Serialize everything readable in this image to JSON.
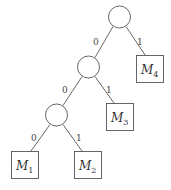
{
  "diagram": {
    "type": "binary-tree",
    "internal_nodes": [
      {
        "id": "n1",
        "cx": 119.5,
        "cy": 17,
        "r": 11
      },
      {
        "id": "n2",
        "cx": 88.5,
        "cy": 67,
        "r": 11
      },
      {
        "id": "n3",
        "cx": 56.5,
        "cy": 115,
        "r": 11
      }
    ],
    "leaves": [
      {
        "id": "M4",
        "base": "M",
        "sub": "4",
        "x": 136,
        "y": 55,
        "w": 28,
        "h": 28
      },
      {
        "id": "M3",
        "base": "M",
        "sub": "3",
        "x": 106,
        "y": 103,
        "w": 28,
        "h": 28
      },
      {
        "id": "M1",
        "base": "M",
        "sub": "1",
        "x": 11,
        "y": 151,
        "w": 28,
        "h": 28
      },
      {
        "id": "M2",
        "base": "M",
        "sub": "2",
        "x": 74,
        "y": 151,
        "w": 28,
        "h": 28
      }
    ],
    "edges": [
      {
        "from": "n1",
        "to": "n2",
        "label": "0"
      },
      {
        "from": "n1",
        "to": "M4",
        "label": "1"
      },
      {
        "from": "n2",
        "to": "n3",
        "label": "0"
      },
      {
        "from": "n2",
        "to": "M3",
        "label": "1"
      },
      {
        "from": "n3",
        "to": "M1",
        "label": "0"
      },
      {
        "from": "n3",
        "to": "M2",
        "label": "1"
      }
    ],
    "edge_labels": {
      "n1_left": "0",
      "n1_right": "1",
      "n2_left": "0",
      "n2_right": "1",
      "n3_left": "0",
      "n3_right": "1"
    },
    "leaf_labels": {
      "m1": {
        "base": "M",
        "sub": "1"
      },
      "m2": {
        "base": "M",
        "sub": "2"
      },
      "m3": {
        "base": "M",
        "sub": "3"
      },
      "m4": {
        "base": "M",
        "sub": "4"
      }
    }
  }
}
